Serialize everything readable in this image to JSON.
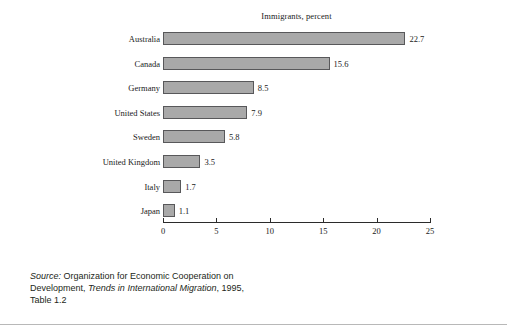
{
  "chart_data": {
    "type": "bar",
    "orientation": "horizontal",
    "title": "Immigrants, percent",
    "xlabel": "",
    "ylabel": "",
    "categories": [
      "Australia",
      "Canada",
      "Germany",
      "United States",
      "Sweden",
      "United Kingdom",
      "Italy",
      "Japan"
    ],
    "values": [
      22.7,
      15.6,
      8.5,
      7.9,
      5.8,
      3.5,
      1.7,
      1.1
    ],
    "value_labels": [
      "22.7",
      "15.6",
      "8.5",
      "7.9",
      "5.8",
      "3.5",
      "1.7",
      "1.1"
    ],
    "xlim": [
      0,
      25
    ],
    "xticks": [
      0,
      5,
      10,
      15,
      20,
      25
    ],
    "xtick_labels": [
      "0",
      "5",
      "10",
      "15",
      "20",
      "25"
    ],
    "grid": false,
    "legend": false,
    "bar_color": "#a9a9a9",
    "bar_border_color": "#58585a",
    "axis_color": "#2b2b2b"
  },
  "source_note": {
    "label": "Source:",
    "line1_rest": " Organization for Economic Cooperation on",
    "line2_pre": "Development, ",
    "line2_italic": "Trends in International Migration",
    "line2_post": ", 1995,",
    "line3": "Table 1.2"
  }
}
